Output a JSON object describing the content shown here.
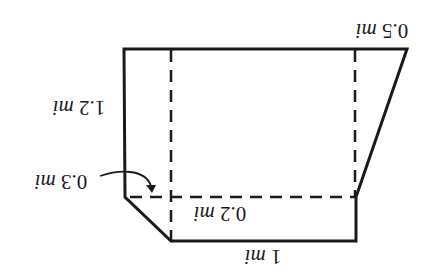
{
  "diagram": {
    "orientation": "rotated 180 degrees (upside-down)",
    "colors": {
      "stroke": "#1a1a1a",
      "background": "#ffffff"
    },
    "labels": {
      "top_right": {
        "value": "0.5",
        "unit": "mi"
      },
      "left_side": {
        "value": "1.2",
        "unit": "mi"
      },
      "corner_callout": {
        "value": "0.3",
        "unit": "mi"
      },
      "inner_strip": {
        "value": "0.2",
        "unit": "mi"
      },
      "bottom": {
        "value": "1",
        "unit": "mi"
      }
    }
  }
}
